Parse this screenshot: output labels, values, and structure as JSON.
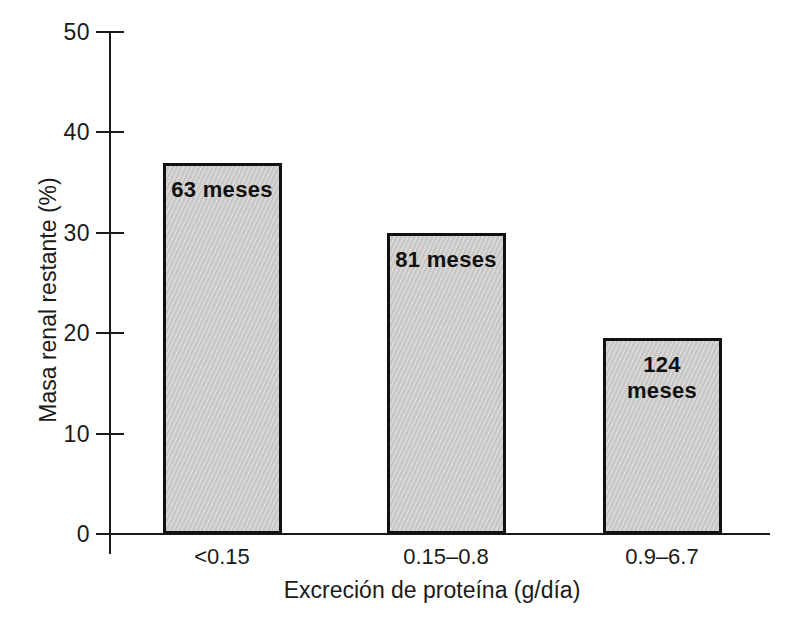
{
  "figure": {
    "background": "#ffffff",
    "text_color": "#1a1a1a"
  },
  "chart_data": {
    "type": "bar",
    "title": "",
    "xlabel": "Excreción de proteína (g/día)",
    "ylabel": "Masa renal restante (%)",
    "categories": [
      "<0.15",
      "0.15–0.8",
      "0.9–6.7"
    ],
    "values": [
      37,
      30,
      19.5
    ],
    "bar_labels": [
      "63 meses",
      "81 meses",
      "124 meses"
    ],
    "ylim": [
      0,
      50
    ],
    "yticks": [
      0,
      10,
      20,
      30,
      40,
      50
    ],
    "grid": false,
    "legend": null,
    "bar_fill": "#cccbc9",
    "bar_border": "#111111",
    "axis_color": "#1a1a1a"
  }
}
